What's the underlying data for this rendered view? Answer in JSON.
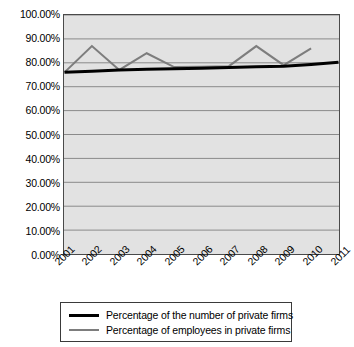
{
  "chart_data": {
    "type": "line",
    "title": "",
    "xlabel": "",
    "ylabel": "",
    "categories": [
      "2001",
      "2002",
      "2003",
      "2004",
      "2005",
      "2006",
      "2007",
      "2008",
      "2009",
      "2010",
      "2011"
    ],
    "ylim": [
      0,
      100
    ],
    "ytick_labels": [
      "0.00%",
      "10.00%",
      "20.00%",
      "30.00%",
      "40.00%",
      "50.00%",
      "60.00%",
      "70.00%",
      "80.00%",
      "90.00%",
      "100.00%"
    ],
    "ytick_values": [
      0,
      10,
      20,
      30,
      40,
      50,
      60,
      70,
      80,
      90,
      100
    ],
    "grid": true,
    "legend_position": "bottom",
    "series": [
      {
        "name": "Percentage of the number of private firms",
        "color": "#000000",
        "width": 3,
        "values": [
          76.0,
          76.5,
          77.0,
          77.3,
          77.5,
          77.7,
          78.0,
          78.3,
          78.6,
          79.3,
          80.2
        ]
      },
      {
        "name": "Percentage of employees in private firms",
        "color": "#7d7d7d",
        "width": 2,
        "values": [
          76.0,
          87.0,
          77.0,
          84.0,
          78.2,
          78.4,
          78.6,
          87.0,
          79.0,
          86.0,
          null
        ]
      }
    ]
  },
  "legend": {
    "entries": [
      {
        "label": "Percentage of the number of private firms"
      },
      {
        "label": "Percentage of employees in private firms"
      }
    ]
  }
}
